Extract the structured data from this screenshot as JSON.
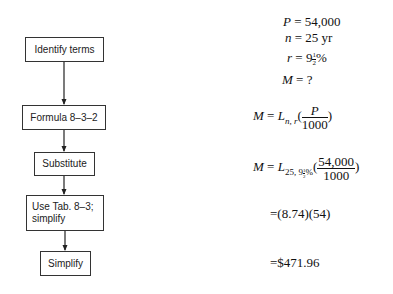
{
  "flowchart": {
    "steps": [
      {
        "label": "Identify terms"
      },
      {
        "label": "Formula 8–3–2"
      },
      {
        "label": "Substitute"
      },
      {
        "label_line1": "Use Tab. 8–3;",
        "label_line2": "simplify"
      },
      {
        "label": "Simplify"
      }
    ]
  },
  "work": {
    "terms": {
      "P": {
        "var": "P",
        "eq": "=",
        "value": "54,000"
      },
      "n": {
        "var": "n",
        "eq": "=",
        "value": "25 yr"
      },
      "r": {
        "var": "r",
        "eq": "=",
        "whole": "9",
        "frac_num": "1",
        "frac_den": "2",
        "unit": "%"
      },
      "M": {
        "var": "M",
        "eq": "=",
        "value": "?"
      }
    },
    "formula": {
      "lhs": "M",
      "eq": "=",
      "L": "L",
      "sub": "n, r",
      "num": "P",
      "den": "1000"
    },
    "substitute": {
      "lhs": "M",
      "eq": "=",
      "L": "L",
      "sub_n": "25, 9",
      "sub_fn": "1",
      "sub_fd": "2",
      "sub_pct": "%",
      "num": "54,000",
      "den": "1000"
    },
    "table_step": "=(8.74)(54)",
    "result": "=$471.96"
  }
}
